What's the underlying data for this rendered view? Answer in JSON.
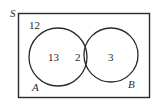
{
  "diagram": {
    "type": "venn",
    "universe_label": "S",
    "sets": [
      {
        "name": "A",
        "label": "A"
      },
      {
        "name": "B",
        "label": "B"
      }
    ],
    "regions": {
      "outside": "12",
      "only_a": "13",
      "a_and_b": "2",
      "only_b": "3"
    },
    "colors": {
      "stroke": "#2a2a2a",
      "background": "#ffffff"
    }
  }
}
